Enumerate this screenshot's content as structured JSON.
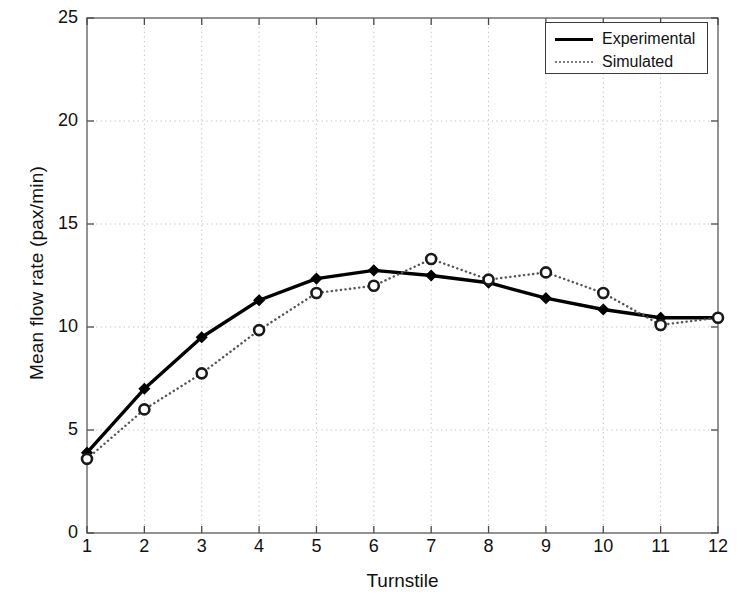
{
  "chart_data": {
    "type": "line",
    "title": "",
    "xlabel": "Turnstile",
    "ylabel": "Mean flow rate (pax/min)",
    "x": [
      1,
      2,
      3,
      4,
      5,
      6,
      7,
      8,
      9,
      10,
      11,
      12
    ],
    "xtick_labels": [
      "1",
      "2",
      "3",
      "4",
      "5",
      "6",
      "7",
      "8",
      "9",
      "10",
      "11",
      "12"
    ],
    "ytick_labels": [
      "0",
      "5",
      "10",
      "15",
      "20",
      "25"
    ],
    "ytick_values": [
      0,
      5,
      10,
      15,
      20,
      25
    ],
    "xlim": [
      1,
      12
    ],
    "ylim": [
      0,
      25
    ],
    "grid": true,
    "legend_position": "upper right",
    "series": [
      {
        "name": "Experimental",
        "style": "solid",
        "marker": "diamond",
        "color": "#000000",
        "values": [
          3.9,
          7.0,
          9.5,
          11.3,
          12.35,
          12.75,
          12.5,
          12.15,
          11.4,
          10.85,
          10.45,
          10.45
        ]
      },
      {
        "name": "Simulated",
        "style": "dotted",
        "marker": "circle",
        "color": "#555555",
        "values": [
          3.6,
          6.0,
          7.75,
          9.85,
          11.65,
          12.0,
          13.3,
          12.3,
          12.65,
          11.65,
          10.1,
          10.45
        ]
      }
    ]
  },
  "legend": {
    "items": [
      {
        "label": "Experimental",
        "sample": "solid-line-sample"
      },
      {
        "label": "Simulated",
        "sample": "dotted-line-sample"
      }
    ]
  },
  "axes": {
    "x_title": "Turnstile",
    "y_title": "Mean flow rate (pax/min)"
  }
}
